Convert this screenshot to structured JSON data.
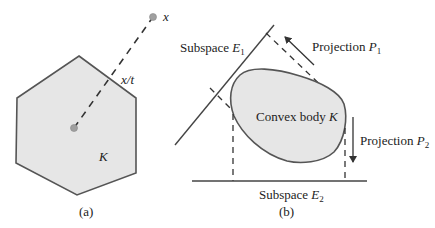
{
  "panel_a": {
    "caption": "(a)",
    "body_label": "K",
    "point_label": "x",
    "scaled_point_label": "x/t"
  },
  "panel_b": {
    "caption": "(b)",
    "body_label": "Convex body",
    "body_symbol": "K",
    "subspace1_label": "Subspace",
    "subspace1_symbol": "E",
    "subspace1_index": "1",
    "subspace2_label": "Subspace",
    "subspace2_symbol": "E",
    "subspace2_index": "2",
    "projection1_label": "Projection",
    "projection1_symbol": "P",
    "projection1_index": "1",
    "projection2_label": "Projection",
    "projection2_symbol": "P",
    "projection2_index": "2"
  },
  "colors": {
    "fill": "#e6e6e6",
    "stroke": "#555555",
    "dot": "#a0a0a0"
  }
}
